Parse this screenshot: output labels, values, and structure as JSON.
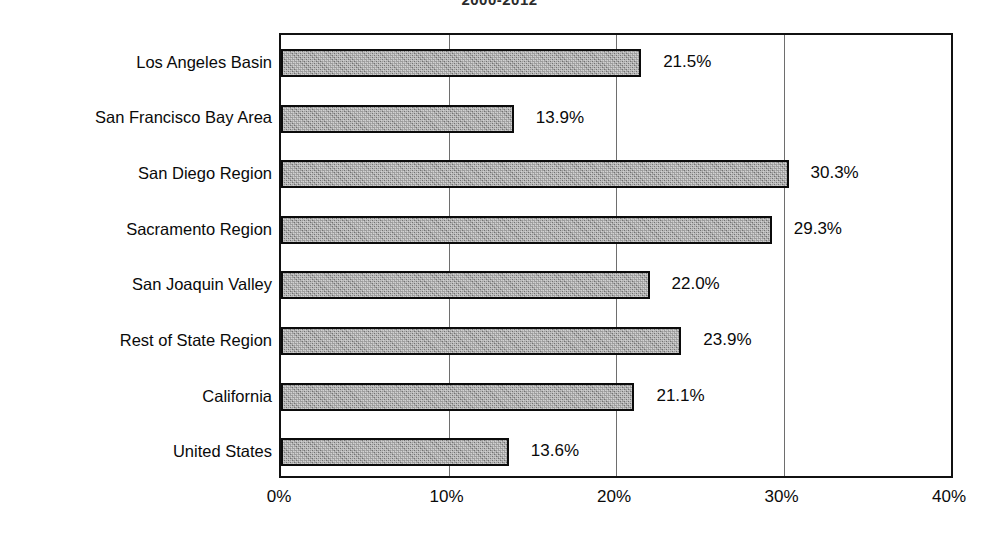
{
  "chart_data": {
    "type": "bar",
    "orientation": "horizontal",
    "title": "2000-2012",
    "xlabel": "",
    "ylabel": "",
    "xlim": [
      0,
      40
    ],
    "xticks": [
      "0%",
      "10%",
      "20%",
      "30%",
      "40%"
    ],
    "xtick_values": [
      0,
      10,
      20,
      30,
      40
    ],
    "grid": true,
    "grid_axis": "x",
    "legend": "none",
    "categories": [
      "Los Angeles Basin",
      "San Francisco Bay Area",
      "San Diego Region",
      "Sacramento Region",
      "San Joaquin Valley",
      "Rest of State Region",
      "California",
      "United States"
    ],
    "values": [
      21.5,
      13.9,
      30.3,
      29.3,
      22.0,
      23.9,
      21.1,
      13.6
    ],
    "data_labels": [
      "21.5%",
      "13.9%",
      "30.3%",
      "29.3%",
      "22.0%",
      "23.9%",
      "21.1%",
      "13.6%"
    ],
    "bar_fill_color": "#8d8d8d",
    "bar_border_color": "#0b0b0b",
    "background_color": "#ffffff",
    "axis_color": "#111111",
    "gridline_color": "#6e6e6e"
  }
}
